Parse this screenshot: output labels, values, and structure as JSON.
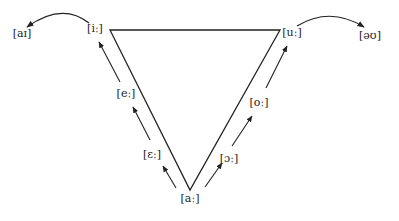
{
  "diagram": {
    "type": "vowel-shift-triangle",
    "colors": {
      "stroke": "#222222",
      "background": "#ffffff"
    },
    "vertices": {
      "top_left": {
        "label": "[iː]",
        "x": 110,
        "y": 30
      },
      "top_right": {
        "label": "[uː]",
        "x": 280,
        "y": 30
      },
      "bottom": {
        "label": "[aː]",
        "x": 190,
        "y": 190
      }
    },
    "labels": {
      "i_long": {
        "text": "[iː]",
        "x": 95,
        "y": 29
      },
      "u_long": {
        "text": "[uː]",
        "x": 292,
        "y": 33
      },
      "a_long": {
        "text": "[aː]",
        "x": 190,
        "y": 199
      },
      "e_long": {
        "text": "[eː]",
        "x": 126,
        "y": 94
      },
      "open_e_long": {
        "text": "[ɛː]",
        "x": 152,
        "y": 155
      },
      "o_long": {
        "text": "[oː]",
        "x": 259,
        "y": 103
      },
      "open_o_long": {
        "text": "[ɔː]",
        "x": 229,
        "y": 159
      },
      "ai": {
        "text": "[aɪ]",
        "x": 22,
        "y": 34
      },
      "au": {
        "text": "[əʊ]",
        "x": 370,
        "y": 36
      }
    },
    "arrows": [
      {
        "name": "a-to-open-e",
        "from": [
          176,
          188
        ],
        "to": [
          163,
          166
        ]
      },
      {
        "name": "open-e-to-e",
        "from": [
          150,
          140
        ],
        "to": [
          133,
          107
        ]
      },
      {
        "name": "e-to-i",
        "from": [
          120,
          82
        ],
        "to": [
          99,
          42
        ]
      },
      {
        "name": "a-to-open-o",
        "from": [
          205,
          187
        ],
        "to": [
          222,
          163
        ]
      },
      {
        "name": "open-o-to-o",
        "from": [
          232,
          146
        ],
        "to": [
          252,
          116
        ]
      },
      {
        "name": "o-to-u",
        "from": [
          266,
          88
        ],
        "to": [
          287,
          46
        ]
      }
    ],
    "curved_arrows": [
      {
        "name": "i-to-ai",
        "path": "M 89 23 Q 62 2 27 27"
      },
      {
        "name": "u-to-au",
        "path": "M 297 26 Q 330 6 364 27"
      }
    ]
  }
}
